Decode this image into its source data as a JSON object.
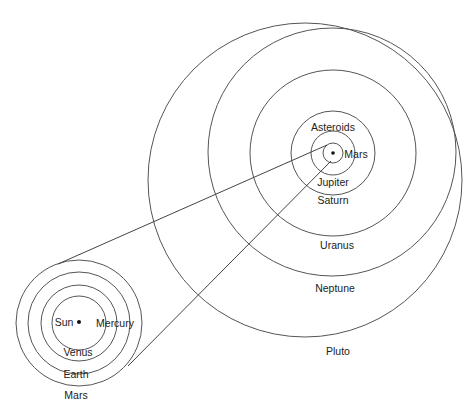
{
  "diagram": {
    "type": "solar-system-orbit-schematic",
    "inner_system": {
      "center_body": "Sun",
      "labels": {
        "sun": "Sun",
        "mercury": "Mercury",
        "venus": "Venus",
        "earth": "Earth",
        "mars": "Mars"
      }
    },
    "outer_system": {
      "labels": {
        "asteroids": "Asteroids",
        "mars": "Mars",
        "jupiter": "Jupiter",
        "saturn": "Saturn",
        "uranus": "Uranus",
        "neptune": "Neptune",
        "pluto": "Pluto"
      }
    },
    "colors": {
      "line": "#555555",
      "text": "#222222",
      "background": "#ffffff"
    }
  }
}
